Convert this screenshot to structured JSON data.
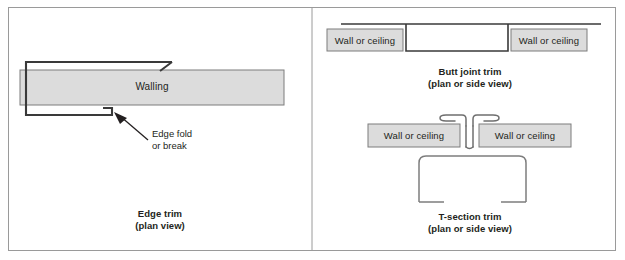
{
  "figure": {
    "width": 625,
    "height": 260,
    "background": "#ffffff",
    "frame_color": "#9a9a9a",
    "line_color": "#3a3a3a",
    "thin_line_color": "#8a8a8a",
    "panel_fill": "#dcdcdc",
    "panel_stroke": "#7d7d7d",
    "text_color": "#231f20"
  },
  "panels": [
    {
      "id": "edge-trim",
      "caption_line1": "Edge trim",
      "caption_line2": "(plan view)",
      "walling_label": "Walling",
      "callout_line1": "Edge fold",
      "callout_line2": "or break"
    },
    {
      "id": "butt-joint-trim",
      "caption_line1": "Butt joint trim",
      "caption_line2": "(plan or side view)",
      "wall_label_left": "Wall or ceiling",
      "wall_label_right": "Wall or ceiling"
    },
    {
      "id": "t-section-trim",
      "caption_line1": "T-section trim",
      "caption_line2": "(plan or side view)",
      "wall_label_left": "Wall or ceiling",
      "wall_label_right": "Wall or ceiling"
    }
  ]
}
